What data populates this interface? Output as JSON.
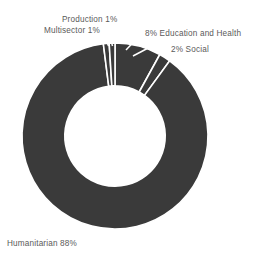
{
  "chart_data": {
    "type": "pie",
    "variant": "donut",
    "title": "",
    "subtitle": "",
    "xlabel": "",
    "ylabel": "",
    "legend": "none",
    "grid": false,
    "units": "percent",
    "total": 100,
    "hole_ratio": 0.54,
    "start_angle_deg": 0,
    "direction": "clockwise",
    "categories": [
      "Education and Health",
      "Social",
      "Humanitarian",
      "Production",
      "Multisector"
    ],
    "values": [
      8,
      2,
      88,
      1,
      1
    ],
    "slices": [
      {
        "label": "Education and Health",
        "value": 8,
        "display": "8% Education and Health",
        "color": "#3a3a3a"
      },
      {
        "label": "Social",
        "value": 2,
        "display": "2% Social",
        "color": "#3a3a3a"
      },
      {
        "label": "Humanitarian",
        "value": 88,
        "display": "Humanitarian 88%",
        "color": "#3a3a3a"
      },
      {
        "label": "Production",
        "value": 1,
        "display": "Production 1%",
        "color": "#3a3a3a"
      },
      {
        "label": "Multisector",
        "value": 1,
        "display": "Multisector 1%",
        "color": "#3a3a3a"
      }
    ]
  },
  "labels": {
    "production": "Production 1%",
    "multisector": "Multisector 1%",
    "education_health": "8% Education and Health",
    "social": "2% Social",
    "humanitarian": "Humanitarian 88%"
  },
  "colors": {
    "slice_fill": "#3a3a3a",
    "slice_divider": "#ffffff",
    "label_text": "#5a5a5a",
    "background": "#ffffff"
  }
}
